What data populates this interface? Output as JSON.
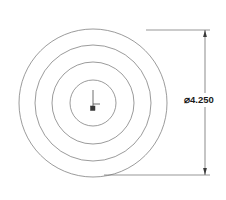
{
  "drawing": {
    "type": "engineering-drawing",
    "view_name": "circular part front view",
    "background_color": "#ffffff",
    "line_color": "#6e6e6e",
    "dimension_color": "#4a4a4a",
    "text_color": "#1a1a1a",
    "center": {
      "x": 93,
      "y": 103
    },
    "circles": [
      {
        "name": "outer-diameter-circle",
        "radius": 74,
        "label": "outer"
      },
      {
        "name": "second-circle",
        "radius": 58,
        "label": "second"
      },
      {
        "name": "third-circle",
        "radius": 41,
        "label": "third"
      },
      {
        "name": "inner-bore-circle",
        "radius": 23,
        "label": "inner"
      }
    ],
    "center_mark": {
      "name": "center-mark",
      "vertical_tick_length": 14,
      "horizontal_tick_length": 7,
      "square_size": 4
    },
    "dimension": {
      "name": "diameter-dimension",
      "symbol": "⌀",
      "value": "4.250",
      "full_text": "⌀4.250",
      "line_x": 205,
      "top_y": 30,
      "bottom_y": 175,
      "extension_top_left_x": 146,
      "extension_bottom_left_x": 104,
      "arrow_size": 5
    }
  }
}
